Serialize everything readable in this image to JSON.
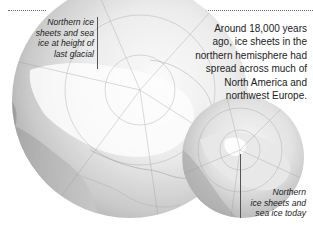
{
  "figure": {
    "past_label": {
      "lines": [
        "Northern ice",
        "sheets and sea",
        "ice at height of",
        "last glacial"
      ]
    },
    "description": {
      "lines": [
        "Around 18,000 years",
        "ago, ice sheets in the",
        "northern hemisphere had",
        "spread across much of",
        "North America and",
        "northwest Europe."
      ]
    },
    "present_label": {
      "lines": [
        "Northern",
        "ice sheets and",
        "sea ice today"
      ]
    },
    "globes": [
      {
        "name": "last-glacial-globe",
        "period": "last glacial maximum (~18,000 years ago)"
      },
      {
        "name": "today-globe",
        "period": "today"
      }
    ],
    "colors": {
      "globe_light": "#f4f4f4",
      "globe_mid": "#c8c8c8",
      "globe_dark": "#8f8f8f",
      "text": "#222222",
      "dotted_rule": "#6d6d6d"
    }
  }
}
